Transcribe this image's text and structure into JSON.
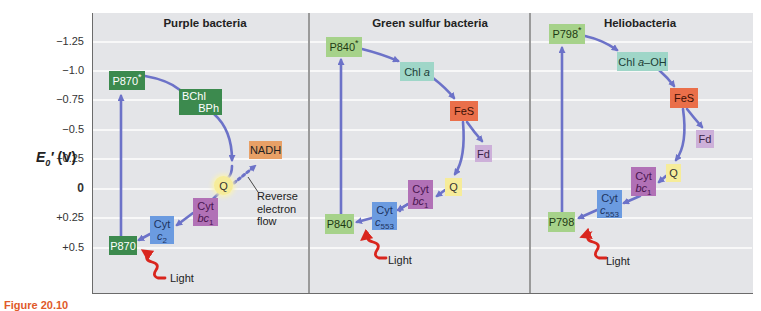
{
  "figure": {
    "caption_fragment": "Figure 20.10"
  },
  "y_axis": {
    "label_main": "E",
    "label_sub": "0",
    "label_prime": "′",
    "label_unit": "(V)",
    "ticks": [
      {
        "label": "−1.25",
        "value": -1.25,
        "y": 42
      },
      {
        "label": "−1.0",
        "value": -1.0,
        "y": 71
      },
      {
        "label": "−0.75",
        "value": -0.75,
        "y": 100
      },
      {
        "label": "−0.5",
        "value": -0.5,
        "y": 130
      },
      {
        "label": "−0.25",
        "value": -0.25,
        "y": 159
      },
      {
        "label": "0",
        "value": 0,
        "y": 189
      },
      {
        "label": "+0.25",
        "value": 0.25,
        "y": 218
      },
      {
        "label": "+0.5",
        "value": 0.5,
        "y": 248
      }
    ]
  },
  "colors": {
    "background": "#e4e5e8",
    "gridline": "#f8f8f8",
    "arrow": "#6c72c8",
    "light_arrow": "#d9251d",
    "dark_green": "#3c8a4e",
    "light_green": "#a6d28a",
    "teal": "#9fd6c8",
    "orange": "#ea6f4a",
    "lavender": "#cdb0d9",
    "purple": "#b171b6",
    "blue": "#6b9be0",
    "yellow": "#f6ec9a",
    "nadh": "#e8a066"
  },
  "panels": [
    {
      "title": "Purple bacteria",
      "components": {
        "p_excited": "P870",
        "bchl": "BChl",
        "bph": "BPh",
        "nadh": "NADH",
        "q": "Q",
        "cyt_bc1_top": "Cyt",
        "cyt_bc1_base": "bc",
        "cyt_bc1_sub": "1",
        "cyt_c_top": "Cyt",
        "cyt_c_base": "c",
        "cyt_c_sub": "2",
        "p_ground": "P870",
        "star": "*"
      },
      "annotation": [
        "Reverse",
        "electron",
        "flow"
      ],
      "light_label": "Light"
    },
    {
      "title": "Green sulfur bacteria",
      "components": {
        "p_excited": "P840",
        "chl_prefix": "Chl ",
        "chl_italic": "a",
        "fes": "FeS",
        "fd": "Fd",
        "q": "Q",
        "cyt_bc1_top": "Cyt",
        "cyt_bc1_base": "bc",
        "cyt_bc1_sub": "1",
        "cyt_c_top": "Cyt",
        "cyt_c_base": "c",
        "cyt_c_sub": "553",
        "p_ground": "P840",
        "star": "*"
      },
      "light_label": "Light"
    },
    {
      "title": "Heliobacteria",
      "components": {
        "p_excited": "P798",
        "chl_prefix": "Chl ",
        "chl_italic": "a",
        "chl_suffix": "–OH",
        "fes": "FeS",
        "fd": "Fd",
        "q": "Q",
        "cyt_bc1_top": "Cyt",
        "cyt_bc1_base": "bc",
        "cyt_bc1_sub": "1",
        "cyt_c_top": "Cyt",
        "cyt_c_base": "c",
        "cyt_c_sub": "553",
        "p_ground": "P798",
        "star": "*"
      },
      "light_label": "Light"
    }
  ]
}
